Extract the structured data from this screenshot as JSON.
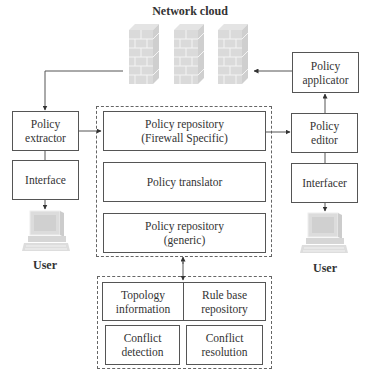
{
  "diagram": {
    "network_cloud_label": "Network cloud",
    "left": {
      "policy_extractor": "Policy\nextractor",
      "interface": "Interface",
      "user_label": "User"
    },
    "center": {
      "policy_repository_firewall": "Policy repository\n(Firewall Specific)",
      "policy_translator": "Policy translator",
      "policy_repository_generic": "Policy repository\n(generic)"
    },
    "bottom": {
      "topology_information": "Topology\ninformation",
      "rule_base_repository": "Rule base\nrepository",
      "conflict_detection": "Conflict\ndetection",
      "conflict_resolution": "Conflict\nresolution"
    },
    "right": {
      "policy_applicator": "Policy\napplicator",
      "policy_editor": "Policy\neditor",
      "interfacer": "Interfacer",
      "user_label": "User"
    },
    "icons": [
      "firewall-icon",
      "firewall-icon",
      "firewall-icon",
      "computer-icon",
      "computer-icon"
    ],
    "colors": {
      "line": "#555555",
      "firewall": "#d9d9d9",
      "computer": "#d9d9d9"
    }
  }
}
